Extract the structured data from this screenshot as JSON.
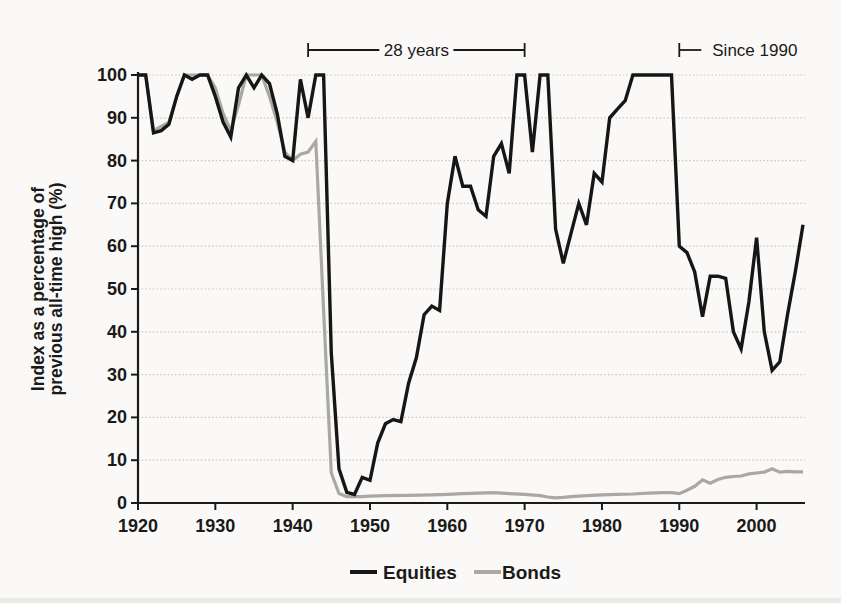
{
  "figure": {
    "background": "#faf9f7",
    "axis_color": "#1a1a1a",
    "grid_color": "#c9c6c2"
  },
  "chart_data": {
    "type": "line",
    "title": "",
    "xlabel": "",
    "ylabel": "Index as a percentage of previous all-time high (%)",
    "ylabel_lines": [
      "Index as a percentage of",
      "previous all-time high (%)"
    ],
    "xlim": [
      1920,
      2006
    ],
    "ylim": [
      0,
      100
    ],
    "xticks": [
      1920,
      1930,
      1940,
      1950,
      1960,
      1970,
      1980,
      1990,
      2000
    ],
    "yticks": [
      0,
      10,
      20,
      30,
      40,
      50,
      60,
      70,
      80,
      90,
      100
    ],
    "grid": "horizontal-dotted",
    "legend_position": "bottom-center",
    "annotations": [
      {
        "id": "bracket-28-years",
        "label": "28 years",
        "style": "span-bracket",
        "year_start": 1942,
        "year_end": 1970
      },
      {
        "id": "bracket-since-1990",
        "label": "Since 1990",
        "style": "open-bracket-right",
        "year_start": 1990
      }
    ],
    "series": [
      {
        "name": "Equities",
        "color": "#161616",
        "width": 3.4,
        "points": [
          [
            1920,
            100
          ],
          [
            1921,
            100
          ],
          [
            1922,
            86.5
          ],
          [
            1923,
            87
          ],
          [
            1924,
            88.5
          ],
          [
            1925,
            95
          ],
          [
            1926,
            100
          ],
          [
            1927,
            99
          ],
          [
            1928,
            100
          ],
          [
            1929,
            100
          ],
          [
            1930,
            95
          ],
          [
            1931,
            89
          ],
          [
            1932,
            85.5
          ],
          [
            1933,
            97
          ],
          [
            1934,
            100
          ],
          [
            1935,
            97
          ],
          [
            1936,
            100
          ],
          [
            1937,
            98
          ],
          [
            1938,
            91
          ],
          [
            1939,
            81
          ],
          [
            1940,
            80
          ],
          [
            1941,
            99
          ],
          [
            1942,
            90
          ],
          [
            1943,
            100
          ],
          [
            1944,
            100
          ],
          [
            1945,
            35
          ],
          [
            1946,
            8
          ],
          [
            1947,
            2.5
          ],
          [
            1948,
            2
          ],
          [
            1949,
            6
          ],
          [
            1950,
            5.3
          ],
          [
            1951,
            14
          ],
          [
            1952,
            18.5
          ],
          [
            1953,
            19.5
          ],
          [
            1954,
            19
          ],
          [
            1955,
            28
          ],
          [
            1956,
            34
          ],
          [
            1957,
            44
          ],
          [
            1958,
            46
          ],
          [
            1959,
            45
          ],
          [
            1960,
            70
          ],
          [
            1961,
            81
          ],
          [
            1962,
            74
          ],
          [
            1963,
            74
          ],
          [
            1964,
            68.5
          ],
          [
            1965,
            67
          ],
          [
            1966,
            81
          ],
          [
            1967,
            84
          ],
          [
            1968,
            77
          ],
          [
            1969,
            100
          ],
          [
            1970,
            100
          ],
          [
            1971,
            82
          ],
          [
            1972,
            100
          ],
          [
            1973,
            100
          ],
          [
            1974,
            64
          ],
          [
            1975,
            56
          ],
          [
            1976,
            63
          ],
          [
            1977,
            70
          ],
          [
            1978,
            65
          ],
          [
            1979,
            77
          ],
          [
            1980,
            75
          ],
          [
            1981,
            90
          ],
          [
            1982,
            92
          ],
          [
            1983,
            94
          ],
          [
            1984,
            100
          ],
          [
            1985,
            100
          ],
          [
            1986,
            100
          ],
          [
            1987,
            100
          ],
          [
            1988,
            100
          ],
          [
            1989,
            100
          ],
          [
            1990,
            60
          ],
          [
            1991,
            58.5
          ],
          [
            1992,
            54
          ],
          [
            1993,
            43.5
          ],
          [
            1994,
            53
          ],
          [
            1995,
            53
          ],
          [
            1996,
            52.5
          ],
          [
            1997,
            40
          ],
          [
            1998,
            36
          ],
          [
            1999,
            47
          ],
          [
            2000,
            62
          ],
          [
            2001,
            40
          ],
          [
            2002,
            31
          ],
          [
            2003,
            33
          ],
          [
            2004,
            44
          ],
          [
            2005,
            54
          ],
          [
            2006,
            65
          ]
        ]
      },
      {
        "name": "Bonds",
        "color": "#aaa8a5",
        "width": 3.2,
        "points": [
          [
            1920,
            100
          ],
          [
            1921,
            100
          ],
          [
            1922,
            87
          ],
          [
            1923,
            88
          ],
          [
            1924,
            89
          ],
          [
            1925,
            95
          ],
          [
            1926,
            100
          ],
          [
            1927,
            100
          ],
          [
            1928,
            100
          ],
          [
            1929,
            100
          ],
          [
            1930,
            97
          ],
          [
            1931,
            91
          ],
          [
            1932,
            87
          ],
          [
            1933,
            93
          ],
          [
            1934,
            100
          ],
          [
            1935,
            100
          ],
          [
            1936,
            100
          ],
          [
            1937,
            95
          ],
          [
            1938,
            89
          ],
          [
            1939,
            82
          ],
          [
            1940,
            80
          ],
          [
            1941,
            81.5
          ],
          [
            1942,
            82
          ],
          [
            1943,
            84.5
          ],
          [
            1944,
            45
          ],
          [
            1945,
            7
          ],
          [
            1946,
            2.2
          ],
          [
            1947,
            1.5
          ],
          [
            1948,
            1.5
          ],
          [
            1949,
            1.5
          ],
          [
            1950,
            1.6
          ],
          [
            1952,
            1.7
          ],
          [
            1955,
            1.8
          ],
          [
            1958,
            1.9
          ],
          [
            1960,
            2
          ],
          [
            1962,
            2.2
          ],
          [
            1964,
            2.3
          ],
          [
            1966,
            2.4
          ],
          [
            1968,
            2.2
          ],
          [
            1970,
            2
          ],
          [
            1972,
            1.7
          ],
          [
            1973,
            1.4
          ],
          [
            1974,
            1.2
          ],
          [
            1975,
            1.3
          ],
          [
            1976,
            1.5
          ],
          [
            1978,
            1.7
          ],
          [
            1980,
            1.9
          ],
          [
            1982,
            2
          ],
          [
            1984,
            2.1
          ],
          [
            1986,
            2.3
          ],
          [
            1988,
            2.4
          ],
          [
            1989,
            2.4
          ],
          [
            1990,
            2.2
          ],
          [
            1991,
            3
          ],
          [
            1992,
            3.9
          ],
          [
            1993,
            5.4
          ],
          [
            1994,
            4.6
          ],
          [
            1995,
            5.5
          ],
          [
            1996,
            6
          ],
          [
            1997,
            6.2
          ],
          [
            1998,
            6.3
          ],
          [
            1999,
            6.8
          ],
          [
            2000,
            7
          ],
          [
            2001,
            7.2
          ],
          [
            2002,
            8
          ],
          [
            2003,
            7.2
          ],
          [
            2004,
            7.4
          ],
          [
            2005,
            7.3
          ],
          [
            2006,
            7.3
          ]
        ]
      }
    ]
  }
}
